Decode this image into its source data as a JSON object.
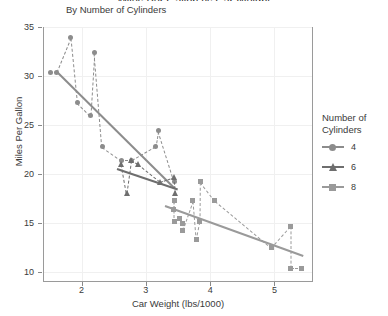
{
  "title": "Miles Per Gallon vs Car Weight",
  "subtitle": "By Number of Cylinders",
  "legend": {
    "title_line1": "Number of",
    "title_line2": "Cylinders",
    "items": [
      {
        "label": "4",
        "shape": "circle",
        "color": "#8c8c8c"
      },
      {
        "label": "6",
        "shape": "triangle",
        "color": "#6e6e6e"
      },
      {
        "label": "8",
        "shape": "square",
        "color": "#9a9a9a"
      }
    ]
  },
  "chart_data": {
    "type": "scatter",
    "title": "Miles Per Gallon vs Car Weight",
    "subtitle": "By Number of Cylinders",
    "xlabel": "Car Weight (lbs/1000)",
    "ylabel": "Miles Per Gallon",
    "xlim": [
      1.4,
      5.6
    ],
    "ylim": [
      9.0,
      35.0
    ],
    "xticks": [
      2,
      3,
      4,
      5
    ],
    "yticks": [
      10,
      15,
      20,
      25,
      30,
      35
    ],
    "grid": true,
    "legend_position": "right",
    "legend_title": "Number of Cylinders",
    "series": [
      {
        "name": "4",
        "shape": "circle",
        "color": "#8c8c8c",
        "points": [
          {
            "x": 1.835,
            "y": 33.9
          },
          {
            "x": 2.2,
            "y": 32.4
          },
          {
            "x": 1.615,
            "y": 30.4
          },
          {
            "x": 1.513,
            "y": 30.4
          },
          {
            "x": 2.14,
            "y": 26.0
          },
          {
            "x": 1.935,
            "y": 27.3
          },
          {
            "x": 2.32,
            "y": 22.8
          },
          {
            "x": 2.62,
            "y": 21.4
          },
          {
            "x": 2.78,
            "y": 21.4
          },
          {
            "x": 3.15,
            "y": 22.8
          },
          {
            "x": 3.19,
            "y": 24.4
          },
          {
            "x": 3.44,
            "y": 19.2
          }
        ],
        "trend_line": {
          "x1": 1.6,
          "y1": 30.6,
          "x2": 3.45,
          "y2": 18.6,
          "style": "solid"
        },
        "connector": {
          "style": "dashed"
        }
      },
      {
        "name": "6",
        "shape": "triangle",
        "color": "#6e6e6e",
        "points": [
          {
            "x": 2.62,
            "y": 21.0
          },
          {
            "x": 2.77,
            "y": 21.4
          },
          {
            "x": 2.875,
            "y": 21.0
          },
          {
            "x": 3.215,
            "y": 19.2
          },
          {
            "x": 3.44,
            "y": 19.7
          },
          {
            "x": 3.46,
            "y": 18.1
          },
          {
            "x": 2.7,
            "y": 18.1
          }
        ],
        "trend_line": {
          "x1": 2.55,
          "y1": 20.6,
          "x2": 3.5,
          "y2": 18.5,
          "style": "solid"
        },
        "connector": {
          "style": "dashed"
        }
      },
      {
        "name": "8",
        "shape": "square",
        "color": "#9a9a9a",
        "points": [
          {
            "x": 3.44,
            "y": 17.3
          },
          {
            "x": 3.44,
            "y": 15.2
          },
          {
            "x": 3.57,
            "y": 15.0
          },
          {
            "x": 3.57,
            "y": 14.3
          },
          {
            "x": 3.52,
            "y": 15.5
          },
          {
            "x": 3.435,
            "y": 16.4
          },
          {
            "x": 3.73,
            "y": 17.3
          },
          {
            "x": 3.84,
            "y": 15.2
          },
          {
            "x": 3.845,
            "y": 19.2
          },
          {
            "x": 4.07,
            "y": 17.3
          },
          {
            "x": 3.78,
            "y": 13.3
          },
          {
            "x": 5.25,
            "y": 14.7
          },
          {
            "x": 5.25,
            "y": 10.4
          },
          {
            "x": 5.424,
            "y": 10.4
          },
          {
            "x": 4.95,
            "y": 12.5
          }
        ],
        "trend_line": {
          "x1": 3.3,
          "y1": 16.9,
          "x2": 5.45,
          "y2": 11.8,
          "style": "solid"
        },
        "connector": {
          "style": "dashed"
        }
      }
    ]
  }
}
